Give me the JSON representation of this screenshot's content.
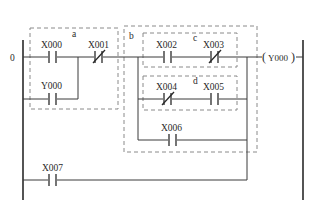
{
  "diagram": {
    "type": "PLC ladder diagram",
    "rung_number": "0",
    "groups": {
      "a": "a",
      "b": "b",
      "c": "c",
      "d": "d"
    },
    "contacts": {
      "x000": {
        "label": "X000",
        "kind": "normally-open"
      },
      "x001": {
        "label": "X001",
        "kind": "normally-closed"
      },
      "y000": {
        "label": "Y000",
        "kind": "normally-open"
      },
      "x002": {
        "label": "X002",
        "kind": "normally-open"
      },
      "x003": {
        "label": "X003",
        "kind": "normally-closed"
      },
      "x004": {
        "label": "X004",
        "kind": "normally-closed"
      },
      "x005": {
        "label": "X005",
        "kind": "normally-open"
      },
      "x006": {
        "label": "X006",
        "kind": "normally-open"
      },
      "x007": {
        "label": "X007",
        "kind": "normally-open"
      }
    },
    "coil": {
      "label": "Y000",
      "open": "(",
      "close": ")"
    },
    "colors": {
      "wire": "#3a3a3a",
      "rail": "#2a2a2a",
      "group_box": "#8a8a8a",
      "background": "#ffffff"
    }
  }
}
